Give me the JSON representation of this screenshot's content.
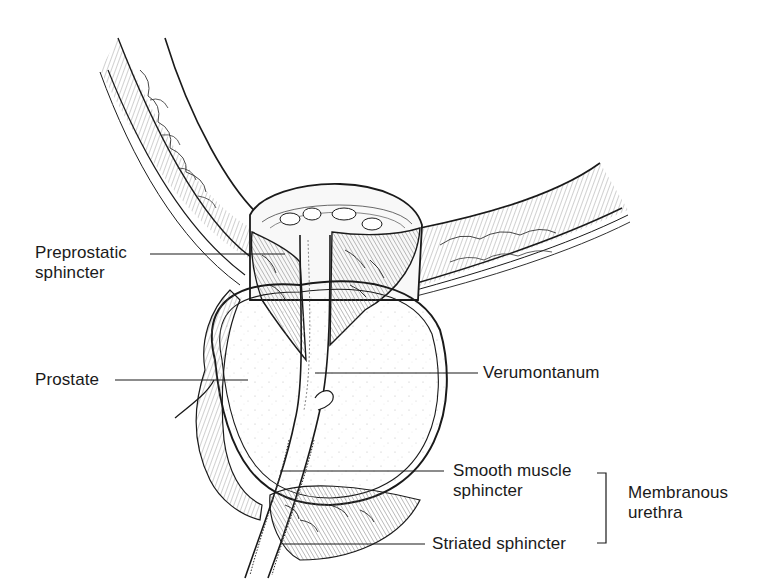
{
  "figure": {
    "type": "anatomical-illustration",
    "style": "black line drawing on white"
  },
  "labels": {
    "preprostatic_sphincter": {
      "line1": "Preprostatic",
      "line2": "sphincter"
    },
    "prostate": {
      "text": "Prostate"
    },
    "verumontanum": {
      "text": "Verumontanum"
    },
    "smooth_muscle_sphincter": {
      "line1": "Smooth muscle",
      "line2": "sphincter"
    },
    "striated_sphincter": {
      "text": "Striated sphincter"
    },
    "membranous_urethra": {
      "line1": "Membranous",
      "line2": "urethra"
    }
  },
  "colors": {
    "ink": "#1a1a1a",
    "background": "#ffffff",
    "tissue_fill": "#f4f4f4",
    "muscle_fill": "#e6e6e6"
  }
}
